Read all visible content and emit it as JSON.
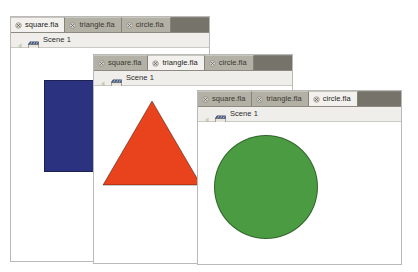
{
  "canvas": {
    "width": 418,
    "height": 272,
    "background": "#ffffff"
  },
  "theme": {
    "tabbar_bg": "#76736a",
    "tab_inactive_bg": "#b3b0a6",
    "tab_active_bg": "#f2f1ed",
    "scenebar_bg": "#efeeea",
    "window_border": "#b9b9b9",
    "text_color": "#3a382f"
  },
  "windows": [
    {
      "id": "window-square",
      "title": "square.fla",
      "x": 10,
      "y": 16,
      "width": 200,
      "height": 246,
      "tabs": [
        {
          "label": "square.fla",
          "active": true,
          "close_icon": "close-icon"
        },
        {
          "label": "triangle.fla",
          "active": false,
          "close_icon": "close-icon"
        },
        {
          "label": "circle.fla",
          "active": false,
          "close_icon": "close-icon"
        }
      ],
      "scene": {
        "label": "Scene 1",
        "back_icon": "back-arrow-icon",
        "icon": "scene-clapperboard-icon"
      },
      "shape": {
        "kind": "square",
        "name": "blue-square",
        "color": "#2b3280",
        "x": 33,
        "y": 32,
        "width": 55,
        "height": 92
      }
    },
    {
      "id": "window-triangle",
      "title": "triangle.fla",
      "x": 93,
      "y": 54,
      "width": 200,
      "height": 210,
      "tabs": [
        {
          "label": "square.fla",
          "active": false,
          "close_icon": "close-icon"
        },
        {
          "label": "triangle.fla",
          "active": true,
          "close_icon": "close-icon"
        },
        {
          "label": "circle.fla",
          "active": false,
          "close_icon": "close-icon"
        }
      ],
      "scene": {
        "label": "Scene 1",
        "back_icon": "back-arrow-icon",
        "icon": "scene-clapperboard-icon"
      },
      "shape": {
        "kind": "triangle",
        "name": "orange-triangle",
        "color": "#e8431c",
        "x": 8,
        "y": 14,
        "width": 100,
        "height": 86
      }
    },
    {
      "id": "window-circle",
      "title": "circle.fla",
      "x": 197,
      "y": 90,
      "width": 205,
      "height": 175,
      "tabs": [
        {
          "label": "square.fla",
          "active": false,
          "close_icon": "close-icon"
        },
        {
          "label": "triangle.fla",
          "active": false,
          "close_icon": "close-icon"
        },
        {
          "label": "circle.fla",
          "active": true,
          "close_icon": "close-icon"
        }
      ],
      "scene": {
        "label": "Scene 1",
        "back_icon": "back-arrow-icon",
        "icon": "scene-clapperboard-icon"
      },
      "shape": {
        "kind": "circle",
        "name": "green-circle",
        "color": "#4a9b41",
        "x": 16,
        "y": 13,
        "width": 104,
        "height": 104
      }
    }
  ]
}
